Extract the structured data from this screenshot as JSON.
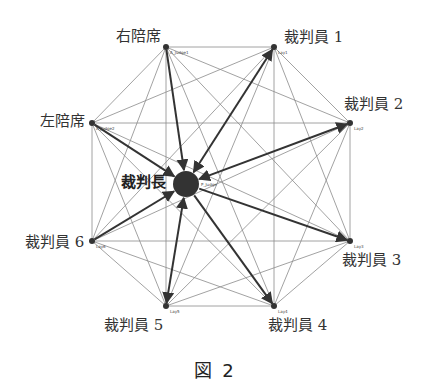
{
  "figure": {
    "caption": "図 2",
    "center": {
      "id": "Judge",
      "label": "裁判長",
      "small_label": "P_Judge",
      "x": 186,
      "y": 184,
      "r": 13,
      "color": "#333333"
    },
    "nodes": [
      {
        "id": "A_Judge1",
        "label": "右陪席",
        "small_label": "A_Judge1",
        "x": 166,
        "y": 47
      },
      {
        "id": "Lay1",
        "label": "裁判員 1",
        "small_label": "Lay1",
        "x": 274,
        "y": 47
      },
      {
        "id": "A_Judge2",
        "label": "左陪席",
        "small_label": "A_Judge2",
        "x": 92,
        "y": 123
      },
      {
        "id": "Lay2",
        "label": "裁判員 2",
        "small_label": "Lay2",
        "x": 350,
        "y": 123
      },
      {
        "id": "Lay6",
        "label": "裁判員 6",
        "small_label": "Lay6",
        "x": 92,
        "y": 241
      },
      {
        "id": "Lay3",
        "label": "裁判員 3",
        "small_label": "Lay3",
        "x": 350,
        "y": 241
      },
      {
        "id": "Lay5",
        "label": "裁判員 5",
        "small_label": "Lay5",
        "x": 166,
        "y": 306
      },
      {
        "id": "Lay4",
        "label": "裁判員 4",
        "small_label": "Lay4",
        "x": 274,
        "y": 306
      }
    ],
    "thick_edges": [
      {
        "from": "Judge",
        "to": "Lay1",
        "bidirectional": true
      },
      {
        "from": "Judge",
        "to": "Lay2",
        "bidirectional": true
      },
      {
        "from": "Judge",
        "to": "Lay5",
        "bidirectional": true
      },
      {
        "from": "A_Judge2",
        "to": "Judge",
        "bidirectional": false
      },
      {
        "from": "A_Judge1",
        "to": "Judge",
        "bidirectional": false
      },
      {
        "from": "Lay6",
        "to": "Judge",
        "bidirectional": false
      },
      {
        "from": "Judge",
        "to": "Lay3",
        "bidirectional": false
      },
      {
        "from": "Judge",
        "to": "Lay4",
        "bidirectional": false
      }
    ],
    "thin_edges": "complete graph among all outer nodes",
    "colors": {
      "thin_edge": "#8a8a8a",
      "thick_edge": "#333333",
      "node": "#333333",
      "text": "#333333"
    }
  }
}
